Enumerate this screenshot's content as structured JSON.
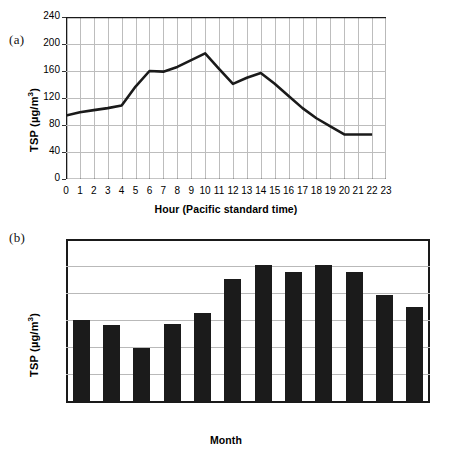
{
  "figure": {
    "panel_a_label": "(a)",
    "panel_b_label": "(b)"
  },
  "chart_data": [
    {
      "id": "panel-a",
      "type": "line",
      "title": "",
      "xlabel": "Hour (Pacific standard time)",
      "ylabel": "TSP (µg/m³)",
      "ylabel_parts": {
        "prefix": "TSP (µg/m",
        "sup": "3",
        "suffix": ")"
      },
      "x": [
        0,
        1,
        2,
        3,
        4,
        5,
        6,
        7,
        8,
        9,
        10,
        11,
        12,
        13,
        14,
        15,
        16,
        17,
        18,
        19,
        20,
        21,
        22
      ],
      "values": [
        94,
        99,
        102,
        105,
        109,
        137,
        160,
        159,
        166,
        176,
        186,
        163,
        141,
        150,
        157,
        141,
        123,
        105,
        90,
        78,
        66,
        66,
        66
      ],
      "xtick_labels": [
        "0",
        "1",
        "2",
        "3",
        "4",
        "5",
        "6",
        "7",
        "8",
        "9",
        "10",
        "11",
        "12",
        "13",
        "14",
        "15",
        "16",
        "17",
        "18",
        "19",
        "20",
        "21",
        "22",
        "23"
      ],
      "xlim": [
        0,
        23
      ],
      "ylim": [
        0,
        240
      ],
      "yticks": [
        0,
        40,
        80,
        120,
        160,
        200,
        240
      ],
      "ytick_labels": [
        "0",
        "40",
        "80",
        "120",
        "160",
        "200",
        "240"
      ],
      "grid": true,
      "legend": "none",
      "line_color": "#1a1a1a"
    },
    {
      "id": "panel-b",
      "type": "bar",
      "title": "",
      "xlabel": "Month",
      "ylabel": "TSP (µg/m³)",
      "ylabel_parts": {
        "prefix": "TSP (µg/m",
        "sup": "3",
        "suffix": ")"
      },
      "categories": [
        "Jan",
        "Feb",
        "Mar",
        "Apr",
        "May",
        "Jun",
        "Jul",
        "Aug",
        "Sep",
        "Oct",
        "Nov",
        "Dec"
      ],
      "values": [
        120,
        112,
        79,
        114,
        131,
        181,
        201,
        191,
        202,
        191,
        157,
        140
      ],
      "ylim": [
        0,
        240
      ],
      "yticks": [
        0,
        40,
        80,
        120,
        160,
        200,
        240
      ],
      "ytick_labels": [
        "0",
        "40",
        "80",
        "120",
        "160",
        "200",
        "240"
      ],
      "grid": true,
      "legend": "none",
      "bar_color": "#1b1b1b"
    }
  ]
}
